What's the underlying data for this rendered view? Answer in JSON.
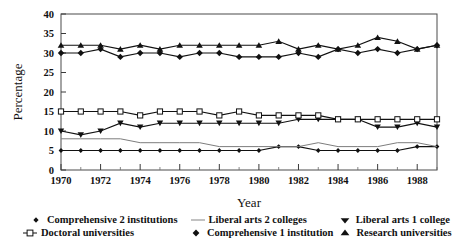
{
  "chart_data": {
    "type": "line",
    "title": "",
    "xlabel": "Year",
    "ylabel": "Percentage",
    "xlim": [
      1970,
      1989
    ],
    "ylim": [
      0,
      40
    ],
    "ytick_step": 5,
    "yticks": [
      0,
      5,
      10,
      15,
      20,
      25,
      30,
      35,
      40
    ],
    "ytick_labels": [
      "0",
      "5",
      "10",
      "15",
      "20",
      "25",
      "30",
      "35",
      "40"
    ],
    "xticks": [
      1970,
      1972,
      1974,
      1976,
      1978,
      1980,
      1982,
      1984,
      1986,
      1988
    ],
    "xtick_labels": [
      "1970",
      "1972",
      "1974",
      "1976",
      "1978",
      "1980",
      "1982",
      "1984",
      "1986",
      "1988"
    ],
    "x": [
      1970,
      1971,
      1972,
      1973,
      1974,
      1975,
      1976,
      1977,
      1978,
      1979,
      1980,
      1981,
      1982,
      1983,
      1984,
      1985,
      1986,
      1987,
      1988,
      1989
    ],
    "grid": false,
    "legend_position": "bottom",
    "series": [
      {
        "name": "Comprehensive 2 institutions",
        "marker": "small-diamond",
        "color": "#111111",
        "values": [
          5,
          5,
          5,
          5,
          5,
          5,
          5,
          5,
          5,
          5,
          5,
          6,
          6,
          5,
          5,
          5,
          5,
          5,
          6,
          6
        ]
      },
      {
        "name": "Liberal arts 2 colleges",
        "marker": "none",
        "color": "#7d7d7d",
        "values": [
          8,
          8,
          8,
          8,
          7,
          7,
          7,
          7,
          6,
          6,
          6,
          6,
          6,
          7,
          6,
          6,
          6,
          7,
          7,
          6
        ]
      },
      {
        "name": "Liberal arts 1 college",
        "marker": "down-triangle",
        "color": "#111111",
        "values": [
          10,
          9,
          10,
          12,
          11,
          12,
          12,
          12,
          12,
          12,
          12,
          12,
          13,
          13,
          13,
          13,
          11,
          11,
          12,
          11
        ]
      },
      {
        "name": "Doctoral universities",
        "marker": "open-square",
        "color": "#111111",
        "values": [
          15,
          15,
          15,
          15,
          14,
          15,
          15,
          15,
          14,
          15,
          14,
          14,
          14,
          14,
          13,
          13,
          13,
          13,
          13,
          13
        ]
      },
      {
        "name": "Comprehensive 1 institution",
        "marker": "filled-diamond",
        "color": "#111111",
        "values": [
          30,
          30,
          31,
          29,
          30,
          30,
          29,
          30,
          30,
          29,
          29,
          29,
          30,
          29,
          31,
          30,
          31,
          30,
          31,
          32
        ]
      },
      {
        "name": "Research universities",
        "marker": "up-triangle",
        "color": "#111111",
        "values": [
          32,
          32,
          32,
          31,
          32,
          31,
          32,
          32,
          32,
          32,
          32,
          33,
          31,
          32,
          31,
          32,
          34,
          33,
          31,
          32
        ]
      }
    ]
  },
  "legend": {
    "row1": [
      {
        "label": "Comprehensive 2 institutions",
        "marker": "small-diamond"
      },
      {
        "label": "Liberal arts 2 colleges",
        "marker": "none"
      },
      {
        "label": "Liberal arts 1 college",
        "marker": "down-triangle"
      }
    ],
    "row2": [
      {
        "label": "Doctoral universities",
        "marker": "open-square"
      },
      {
        "label": "Comprehensive 1 institution",
        "marker": "filled-diamond"
      },
      {
        "label": "Research universities",
        "marker": "up-triangle"
      }
    ]
  }
}
